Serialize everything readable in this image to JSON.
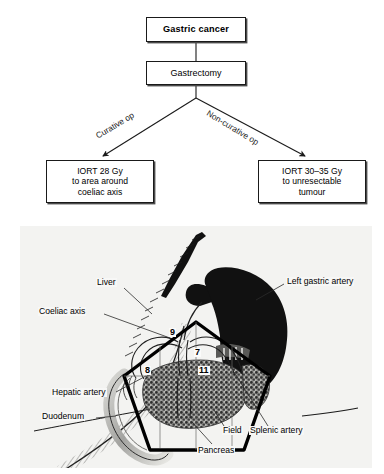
{
  "flowchart": {
    "boxes": [
      {
        "id": "gastric-cancer",
        "text": [
          "Gastric cancer"
        ]
      },
      {
        "id": "gastrectomy",
        "text": [
          "Gastrectomy"
        ]
      },
      {
        "id": "iort-curative",
        "text": [
          "IORT 28 Gy",
          "to area around",
          "coeliac axis"
        ]
      },
      {
        "id": "iort-noncurative",
        "text": [
          "IORT 30–35 Gy",
          "to unresectable",
          "tumour"
        ]
      }
    ],
    "box_gastric_cancer_line1": "Gastric cancer",
    "box_gastrectomy_line1": "Gastrectomy",
    "box_curative_line1": "IORT 28 Gy",
    "box_curative_line2": "to area around",
    "box_curative_line3": "coeliac axis",
    "box_noncurative_line1": "IORT 30–35 Gy",
    "box_noncurative_line2": "to unresectable",
    "box_noncurative_line3": "tumour",
    "edge_labels": {
      "left": "Curative op",
      "right": "Non-curative op"
    }
  },
  "illustration": {
    "labels": {
      "liver": "Liver",
      "coeliac_axis": "Coeliac axis",
      "left_gastric_artery": "Left gastric artery",
      "hepatic_artery": "Hepatic artery",
      "duodenum": "Duodenum",
      "field": "Field",
      "splenic_artery": "Splenic artery",
      "pancreas": "Pancreas"
    },
    "lymph_node_stations": {
      "n9": "9",
      "n7": "7",
      "n8": "8",
      "n11": "11"
    }
  },
  "colors": {
    "panel_background": "#f3f3f1",
    "box_border": "#1a1a1a",
    "box_shadow": "#4a4a4a",
    "organ_dark": "#111111",
    "field_outline": "#000000",
    "text": "#000000"
  }
}
